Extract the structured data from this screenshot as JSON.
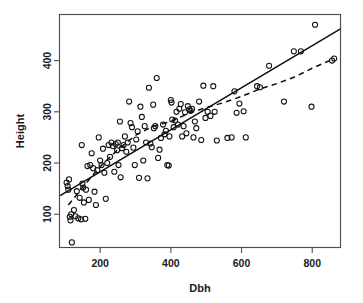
{
  "chart_data": {
    "type": "scatter",
    "title": "",
    "xlabel": "Dbh",
    "ylabel": "Height",
    "xlim": [
      85,
      880
    ],
    "ylim": [
      35,
      490
    ],
    "xticks": [
      200,
      400,
      600,
      800
    ],
    "yticks": [
      100,
      200,
      300,
      400
    ],
    "grid": false,
    "legend": null,
    "marker": "open-circle",
    "points": [
      [
        105,
        162
      ],
      [
        108,
        155
      ],
      [
        110,
        148
      ],
      [
        112,
        168
      ],
      [
        114,
        95
      ],
      [
        116,
        88
      ],
      [
        118,
        100
      ],
      [
        120,
        45
      ],
      [
        126,
        108
      ],
      [
        130,
        96
      ],
      [
        134,
        145
      ],
      [
        138,
        92
      ],
      [
        142,
        132
      ],
      [
        146,
        90
      ],
      [
        148,
        235
      ],
      [
        150,
        160
      ],
      [
        152,
        152
      ],
      [
        154,
        123
      ],
      [
        158,
        91
      ],
      [
        160,
        148
      ],
      [
        164,
        194
      ],
      [
        168,
        128
      ],
      [
        172,
        196
      ],
      [
        176,
        219
      ],
      [
        180,
        190
      ],
      [
        184,
        144
      ],
      [
        188,
        118
      ],
      [
        192,
        186
      ],
      [
        196,
        250
      ],
      [
        200,
        205
      ],
      [
        204,
        196
      ],
      [
        208,
        228
      ],
      [
        212,
        181
      ],
      [
        216,
        130
      ],
      [
        220,
        200
      ],
      [
        224,
        235
      ],
      [
        228,
        212
      ],
      [
        232,
        240
      ],
      [
        236,
        233
      ],
      [
        240,
        183
      ],
      [
        244,
        237
      ],
      [
        248,
        225
      ],
      [
        250,
        240
      ],
      [
        252,
        196
      ],
      [
        256,
        281
      ],
      [
        258,
        172
      ],
      [
        262,
        229
      ],
      [
        266,
        235
      ],
      [
        270,
        252
      ],
      [
        274,
        222
      ],
      [
        278,
        240
      ],
      [
        282,
        320
      ],
      [
        286,
        278
      ],
      [
        290,
        270
      ],
      [
        294,
        230
      ],
      [
        298,
        196
      ],
      [
        302,
        246
      ],
      [
        306,
        262
      ],
      [
        310,
        171
      ],
      [
        314,
        310
      ],
      [
        318,
        290
      ],
      [
        322,
        205
      ],
      [
        326,
        272
      ],
      [
        330,
        240
      ],
      [
        334,
        170
      ],
      [
        338,
        347
      ],
      [
        342,
        238
      ],
      [
        346,
        231
      ],
      [
        350,
        314
      ],
      [
        352,
        268
      ],
      [
        356,
        272
      ],
      [
        360,
        366
      ],
      [
        364,
        210
      ],
      [
        368,
        226
      ],
      [
        372,
        249
      ],
      [
        378,
        275
      ],
      [
        382,
        256
      ],
      [
        386,
        263
      ],
      [
        390,
        196
      ],
      [
        394,
        195
      ],
      [
        396,
        252
      ],
      [
        400,
        323
      ],
      [
        402,
        318
      ],
      [
        404,
        285
      ],
      [
        408,
        270
      ],
      [
        412,
        283
      ],
      [
        416,
        300
      ],
      [
        420,
        275
      ],
      [
        424,
        306
      ],
      [
        428,
        315
      ],
      [
        432,
        252
      ],
      [
        436,
        272
      ],
      [
        440,
        299
      ],
      [
        444,
        258
      ],
      [
        448,
        311
      ],
      [
        452,
        305
      ],
      [
        456,
        302
      ],
      [
        460,
        306
      ],
      [
        464,
        250
      ],
      [
        468,
        281
      ],
      [
        472,
        268
      ],
      [
        480,
        320
      ],
      [
        486,
        245
      ],
      [
        492,
        351
      ],
      [
        498,
        288
      ],
      [
        504,
        300
      ],
      [
        512,
        292
      ],
      [
        520,
        350
      ],
      [
        524,
        300
      ],
      [
        530,
        244
      ],
      [
        560,
        249
      ],
      [
        572,
        250
      ],
      [
        580,
        340
      ],
      [
        586,
        298
      ],
      [
        594,
        316
      ],
      [
        606,
        301
      ],
      [
        612,
        250
      ],
      [
        644,
        350
      ],
      [
        652,
        348
      ],
      [
        678,
        390
      ],
      [
        720,
        320
      ],
      [
        768,
        418
      ],
      [
        748,
        418
      ],
      [
        798,
        310
      ],
      [
        808,
        470
      ],
      [
        856,
        400
      ],
      [
        862,
        404
      ]
    ],
    "fits": [
      {
        "name": "linear-fit",
        "style": "solid",
        "x": [
          88,
          880
        ],
        "y": [
          137,
          462
        ]
      },
      {
        "name": "smooth-fit",
        "style": "dashed",
        "x": [
          110,
          150,
          200,
          250,
          300,
          350,
          400,
          450,
          500,
          550,
          600,
          650,
          700,
          750,
          800,
          862
        ],
        "y": [
          118,
          152,
          193,
          226,
          254,
          272,
          281,
          297,
          308,
          318,
          330,
          344,
          355,
          368,
          385,
          404
        ]
      }
    ]
  },
  "axes": {
    "x_title": "Dbh",
    "y_title": "Height",
    "x_tick_labels": [
      "200",
      "400",
      "600",
      "800"
    ],
    "y_tick_labels": [
      "100",
      "200",
      "300",
      "400"
    ]
  },
  "colors": {
    "point_stroke": "#111111",
    "fit_line": "#0d0d0d",
    "frame": "#4d4d4d",
    "background": "#ffffff"
  }
}
